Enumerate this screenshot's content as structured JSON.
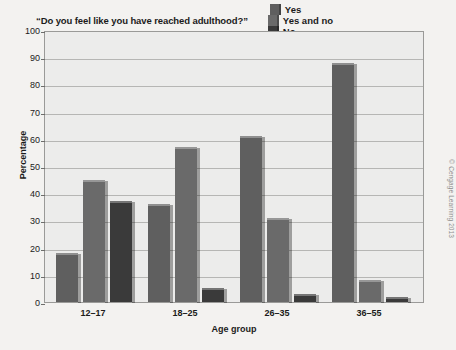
{
  "chart_data": {
    "type": "bar",
    "title": "“Do you feel like you have reached adulthood?”",
    "xlabel": "Age group",
    "ylabel": "Percentage",
    "categories": [
      "12–17",
      "18–25",
      "26–35",
      "36–55"
    ],
    "series": [
      {
        "name": "Yes",
        "color": "#5f5f5f",
        "values": [
          18,
          36,
          61,
          88
        ]
      },
      {
        "name": "Yes and no",
        "color": "#6a6a6a",
        "values": [
          45,
          57,
          31,
          8
        ]
      },
      {
        "name": "No",
        "color": "#3a3a3a",
        "values": [
          37,
          5,
          3,
          2
        ]
      }
    ],
    "ylim": [
      0,
      100
    ],
    "yticks": [
      0,
      10,
      20,
      30,
      40,
      50,
      60,
      70,
      80,
      90,
      100
    ],
    "grid": true,
    "legend_position": "top-right",
    "plot_background": "#ececeb",
    "figure_background": "#f3f2f0"
  },
  "credit": "© Cengage Learning 2013"
}
